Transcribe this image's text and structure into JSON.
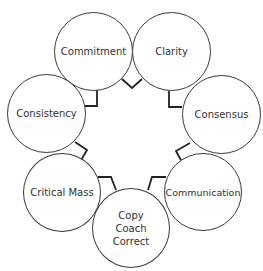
{
  "diagram": {
    "type": "cycle",
    "nodes": [
      {
        "id": "commitment",
        "label": "Commitment"
      },
      {
        "id": "clarity",
        "label": "Clarity"
      },
      {
        "id": "consensus",
        "label": "Consensus"
      },
      {
        "id": "communication",
        "label": "Communication"
      },
      {
        "id": "copy-coach-correct",
        "label": "Copy\nCoach\nCorrect"
      },
      {
        "id": "critical-mass",
        "label": "Critical Mass"
      },
      {
        "id": "consistency",
        "label": "Consistency"
      }
    ],
    "colors": {
      "stroke": "#3a3a3a",
      "connector": "#222222",
      "text": "#333333",
      "background": "#ffffff"
    }
  }
}
